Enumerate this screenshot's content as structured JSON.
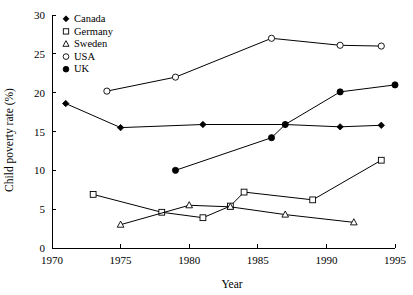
{
  "chart_data": {
    "type": "line",
    "title": "",
    "xlabel": "Year",
    "ylabel": "Child poverty rate (%)",
    "xlim": [
      1970,
      1995
    ],
    "ylim": [
      0,
      30
    ],
    "xticks": [
      1970,
      1975,
      1980,
      1985,
      1990,
      1995
    ],
    "xtick_labels": [
      "1970",
      "1975",
      "1980",
      "1985",
      "1990",
      "1995"
    ],
    "yticks": [
      0,
      5,
      10,
      15,
      20,
      25,
      30
    ],
    "ytick_labels": [
      "0",
      "5",
      "10",
      "15",
      "20",
      "25",
      "30"
    ],
    "grid": false,
    "legend_position": "top-left",
    "series": [
      {
        "name": "Canada",
        "marker": "filled-diamond",
        "color": "#000000",
        "x": [
          1971,
          1975,
          1981,
          1987,
          1991,
          1994
        ],
        "values": [
          18.6,
          15.5,
          15.9,
          15.9,
          15.6,
          15.8
        ]
      },
      {
        "name": "Germany",
        "marker": "open-square",
        "color": "#000000",
        "x": [
          1973,
          1978,
          1981,
          1983,
          1984,
          1989,
          1994
        ],
        "values": [
          6.9,
          4.6,
          3.9,
          5.4,
          7.2,
          6.2,
          11.3
        ]
      },
      {
        "name": "Sweden",
        "marker": "open-triangle",
        "color": "#000000",
        "x": [
          1975,
          1980,
          1983,
          1987,
          1992
        ],
        "values": [
          3.0,
          5.5,
          5.3,
          4.3,
          3.3
        ]
      },
      {
        "name": "USA",
        "marker": "open-circle",
        "color": "#000000",
        "x": [
          1974,
          1979,
          1986,
          1991,
          1994
        ],
        "values": [
          20.2,
          22.0,
          27.0,
          26.1,
          26.0
        ]
      },
      {
        "name": "UK",
        "marker": "filled-circle",
        "color": "#000000",
        "x": [
          1979,
          1986,
          1987,
          1991,
          1995
        ],
        "values": [
          10.0,
          14.2,
          15.9,
          20.1,
          21.0
        ]
      }
    ]
  }
}
